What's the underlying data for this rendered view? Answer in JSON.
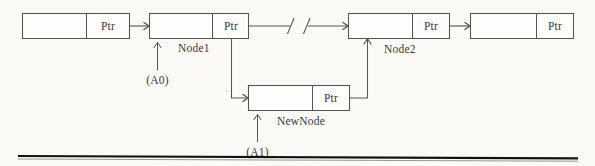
{
  "diagram": {
    "background_color": "#fbfaf7",
    "stroke_color": "#565452",
    "text_color": "#3a3836",
    "rule_color": "#111111",
    "pointer_field_label": "Ptr",
    "nodes": [
      {
        "id": "head-node",
        "data_label": "",
        "pointer_label": "Ptr",
        "name_label": "",
        "address_label": ""
      },
      {
        "id": "node1",
        "data_label": "",
        "pointer_label": "Ptr",
        "name_label": "Node1",
        "address_label": "(A0)"
      },
      {
        "id": "node2",
        "data_label": "",
        "pointer_label": "Ptr",
        "name_label": "Node2",
        "address_label": ""
      },
      {
        "id": "tail-node",
        "data_label": "",
        "pointer_label": "Ptr",
        "name_label": "",
        "address_label": ""
      },
      {
        "id": "new-node",
        "data_label": "",
        "pointer_label": "Ptr",
        "name_label": "NewNode",
        "address_label": "(A1)"
      }
    ],
    "labels": {
      "node1_name": "Node1",
      "node1_address": "(A0)",
      "node2_name": "Node2",
      "newnode_name": "NewNode",
      "newnode_address": "(A1)"
    },
    "cells": {
      "head_ptr": "Ptr",
      "node1_ptr": "Ptr",
      "node2_ptr": "Ptr",
      "tail_ptr": "Ptr",
      "newnode_ptr": "Ptr"
    },
    "break_mark": {
      "present": true,
      "description": "list-continuation break"
    }
  }
}
